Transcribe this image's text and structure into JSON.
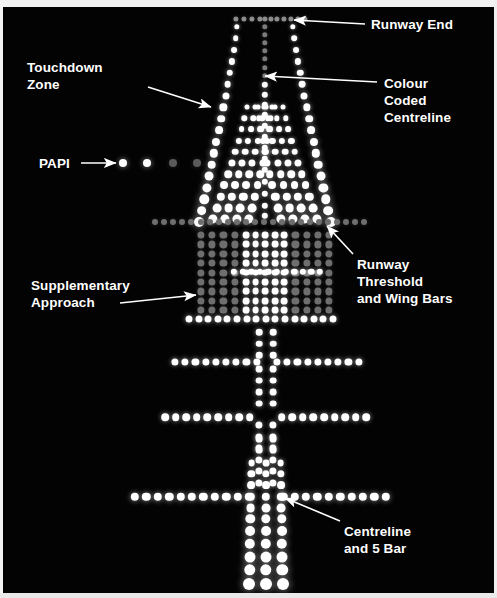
{
  "figure": {
    "kind": "airfield-approach-lighting-night-photo",
    "background_color": "#030303",
    "border_color": "#f2f2f2"
  },
  "colors": {
    "white_light": "#ffffff",
    "bright_white": "#ffffff",
    "dim_gray_light": "#6e6e6e",
    "mid_gray_light": "#8d8d8d",
    "faint_gray_light": "#4a4a4a",
    "annotation_text": "#ffffff",
    "arrow_stroke": "#ffffff"
  },
  "labels": [
    {
      "id": "runway-end",
      "lines": [
        "Runway End"
      ],
      "x": 368,
      "y": 9,
      "align": "left"
    },
    {
      "id": "touchdown-zone",
      "lines": [
        "Touchdown",
        "Zone"
      ],
      "x": 24,
      "y": 52,
      "align": "left"
    },
    {
      "id": "colour-coded-centreline",
      "lines": [
        "Colour",
        "Coded",
        "Centreline"
      ],
      "x": 381,
      "y": 68,
      "align": "left"
    },
    {
      "id": "papi",
      "lines": [
        "PAPI"
      ],
      "x": 36,
      "y": 148,
      "align": "left"
    },
    {
      "id": "runway-threshold-and-wing-bars",
      "lines": [
        "Runway",
        "Threshold",
        "and Wing Bars"
      ],
      "x": 354,
      "y": 249,
      "align": "left"
    },
    {
      "id": "supplementary-approach",
      "lines": [
        "Supplementary",
        "Approach"
      ],
      "x": 28,
      "y": 270,
      "align": "left"
    },
    {
      "id": "centreline-and-5-bar",
      "lines": [
        "Centreline",
        "and 5 Bar"
      ],
      "x": 341,
      "y": 516,
      "align": "left"
    }
  ],
  "arrows": [
    {
      "id": "arrow-runway-end",
      "x1": 362,
      "y1": 17,
      "x2": 291,
      "y2": 13
    },
    {
      "id": "arrow-touchdown-zone",
      "x1": 145,
      "y1": 80,
      "x2": 208,
      "y2": 100
    },
    {
      "id": "arrow-colour-centreline",
      "x1": 374,
      "y1": 75,
      "x2": 262,
      "y2": 69
    },
    {
      "id": "arrow-papi",
      "x1": 78,
      "y1": 156,
      "x2": 113,
      "y2": 156
    },
    {
      "id": "arrow-threshold",
      "x1": 350,
      "y1": 247,
      "x2": 324,
      "y2": 219
    },
    {
      "id": "arrow-supplementary",
      "x1": 117,
      "y1": 296,
      "x2": 193,
      "y2": 288
    },
    {
      "id": "arrow-centreline-5bar",
      "x1": 337,
      "y1": 514,
      "x2": 282,
      "y2": 491
    }
  ],
  "light_groups": [
    {
      "id": "runway-end-bar",
      "name": "Runway End",
      "count": 11,
      "color": "#8d8d8d"
    },
    {
      "id": "colour-coded-centreline",
      "name": "Colour Coded Centreline",
      "count": 34,
      "color": "#ffffff"
    },
    {
      "id": "runway-edge-left",
      "name": "Left Runway Edge",
      "count": 17,
      "color": "#ffffff"
    },
    {
      "id": "runway-edge-right",
      "name": "Right Runway Edge",
      "count": 17,
      "color": "#ffffff"
    },
    {
      "id": "touchdown-zone-left",
      "name": "Touchdown Zone Left",
      "count": 40,
      "color": "#ffffff"
    },
    {
      "id": "touchdown-zone-right",
      "name": "Touchdown Zone Right",
      "count": 40,
      "color": "#ffffff"
    },
    {
      "id": "papi",
      "name": "PAPI",
      "count": 4,
      "color": "#ffffff"
    },
    {
      "id": "runway-threshold-bar",
      "name": "Runway Threshold",
      "count": 40,
      "color": "#6e6e6e"
    },
    {
      "id": "wing-bar-left",
      "name": "Left Wing Bar",
      "count": 36,
      "color": "#6e6e6e"
    },
    {
      "id": "wing-bar-right",
      "name": "Right Wing Bar",
      "count": 36,
      "color": "#6e6e6e"
    },
    {
      "id": "supplementary-approach",
      "name": "Supplementary Approach",
      "count": 72,
      "color": "#6e6e6e"
    },
    {
      "id": "approach-centreline",
      "name": "Approach Centreline",
      "count": 60,
      "color": "#ffffff"
    },
    {
      "id": "crossbar-1",
      "name": "Crossbar 1",
      "count": 21,
      "color": "#ffffff"
    },
    {
      "id": "crossbar-2",
      "name": "Crossbar 2",
      "count": 19,
      "color": "#ffffff"
    },
    {
      "id": "crossbar-3",
      "name": "Crossbar 3",
      "count": 21,
      "color": "#ffffff"
    },
    {
      "id": "crossbar-4",
      "name": "Crossbar 4",
      "count": 21,
      "color": "#ffffff"
    },
    {
      "id": "five-bar-centreline",
      "name": "Centreline and 5 Bar",
      "count": 33,
      "color": "#ffffff"
    }
  ],
  "light_layout": {
    "runway_end": {
      "y": 12,
      "xs": [
        233,
        241,
        249,
        257,
        268,
        274,
        281,
        288,
        295,
        302
      ],
      "r": 2.6,
      "color": "#8d8d8d"
    },
    "runway_end_extra": {
      "x": 262,
      "y": 12,
      "r": 2.6,
      "color": "#8d8d8d"
    },
    "centre_column_dim": {
      "x": 262,
      "ys": [
        20,
        28,
        36,
        44,
        52,
        61,
        69
      ],
      "r": 2.7,
      "color": "#7b7b7b"
    },
    "centre_column_bright": {
      "x": 262,
      "ys": [
        78,
        88,
        98,
        108,
        119,
        130,
        141,
        152,
        163,
        175,
        187,
        199,
        209
      ],
      "r": 3.2,
      "color": "#ffffff"
    },
    "papi": [
      {
        "x": 120,
        "y": 156,
        "r": 4.0,
        "color": "#ffffff"
      },
      {
        "x": 144,
        "y": 156,
        "r": 4.0,
        "color": "#ffffff"
      },
      {
        "x": 170,
        "y": 156,
        "r": 4.0,
        "color": "#5a5a5a"
      },
      {
        "x": 194,
        "y": 156,
        "r": 4.0,
        "color": "#5a5a5a"
      }
    ]
  },
  "annotation_count": 7
}
